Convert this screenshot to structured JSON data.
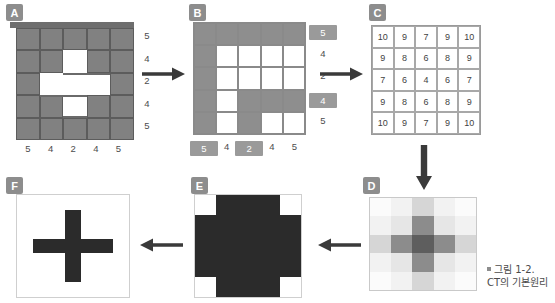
{
  "figure": {
    "caption_marker": "■",
    "caption_line1": "그림 1-2.",
    "caption_line2": "CT의 기본원리"
  },
  "colors": {
    "badge_bg": "#8d8d8d",
    "block_gray": "#818181",
    "grid_gray": "#8e8e8e",
    "dark": "#2b2b2b",
    "text": "#4a4a4a"
  },
  "panels": {
    "a": {
      "label": "A",
      "title": "object-block-stack",
      "row_labels": [
        "5",
        "4",
        "2",
        "4",
        "5"
      ],
      "col_labels": [
        "5",
        "4",
        "2",
        "4",
        "5"
      ],
      "occupancy": [
        [
          1,
          1,
          1,
          1,
          1
        ],
        [
          1,
          1,
          0,
          1,
          1
        ],
        [
          1,
          0,
          0,
          0,
          1
        ],
        [
          1,
          1,
          0,
          1,
          1
        ],
        [
          1,
          1,
          1,
          1,
          1
        ]
      ]
    },
    "b": {
      "label": "B",
      "title": "projection-grid",
      "row_labels": [
        "5",
        "4",
        "2",
        "4",
        "5"
      ],
      "row_highlight": [
        true,
        false,
        false,
        true,
        false
      ],
      "col_labels": [
        "5",
        "4",
        "2",
        "4",
        "5"
      ],
      "col_highlight": [
        true,
        false,
        true,
        false,
        false
      ],
      "cells": [
        [
          1,
          1,
          1,
          1,
          1
        ],
        [
          1,
          0,
          0,
          0,
          0
        ],
        [
          1,
          0,
          0,
          0,
          0
        ],
        [
          1,
          0,
          1,
          1,
          1
        ],
        [
          1,
          0,
          1,
          0,
          0
        ]
      ]
    },
    "c": {
      "label": "C",
      "title": "attenuation-matrix",
      "values": [
        [
          10,
          9,
          7,
          9,
          10
        ],
        [
          9,
          8,
          6,
          8,
          9
        ],
        [
          7,
          6,
          4,
          6,
          7
        ],
        [
          9,
          8,
          6,
          8,
          9
        ],
        [
          10,
          9,
          7,
          9,
          10
        ]
      ],
      "min": 4,
      "max": 10
    },
    "d": {
      "label": "D",
      "title": "grayscale-heatmap",
      "values": [
        [
          10,
          9,
          7,
          9,
          10
        ],
        [
          9,
          8,
          6,
          8,
          9
        ],
        [
          7,
          6,
          4,
          6,
          7
        ],
        [
          9,
          8,
          6,
          8,
          9
        ],
        [
          10,
          9,
          7,
          9,
          10
        ]
      ],
      "shades": [
        [
          "#fbfbfb",
          "#f2f2f2",
          "#d6d6d6",
          "#f2f2f2",
          "#fbfbfb"
        ],
        [
          "#f2f2f2",
          "#e6e6e6",
          "#8c8c8c",
          "#e6e6e6",
          "#f2f2f2"
        ],
        [
          "#d6d6d6",
          "#8c8c8c",
          "#5e5e5e",
          "#8c8c8c",
          "#d6d6d6"
        ],
        [
          "#f2f2f2",
          "#e6e6e6",
          "#8c8c8c",
          "#e6e6e6",
          "#f2f2f2"
        ],
        [
          "#fbfbfb",
          "#f2f2f2",
          "#d6d6d6",
          "#f2f2f2",
          "#fbfbfb"
        ]
      ]
    },
    "e": {
      "label": "E",
      "title": "thresholded-image",
      "cells": [
        [
          0,
          1,
          1,
          1,
          0
        ],
        [
          1,
          1,
          1,
          1,
          1
        ],
        [
          1,
          1,
          1,
          1,
          1
        ],
        [
          1,
          1,
          1,
          1,
          1
        ],
        [
          0,
          1,
          1,
          1,
          0
        ]
      ]
    },
    "f": {
      "label": "F",
      "title": "reconstructed-cross",
      "cells": [
        [
          0,
          0,
          0,
          0,
          0,
          0,
          0
        ],
        [
          0,
          0,
          0,
          1,
          0,
          0,
          0
        ],
        [
          0,
          0,
          0,
          1,
          0,
          0,
          0
        ],
        [
          0,
          1,
          1,
          1,
          1,
          1,
          0
        ],
        [
          0,
          0,
          0,
          1,
          0,
          0,
          0
        ],
        [
          0,
          0,
          0,
          1,
          0,
          0,
          0
        ],
        [
          0,
          0,
          0,
          0,
          0,
          0,
          0
        ]
      ]
    }
  },
  "arrows": [
    {
      "name": "arrow-a-to-b",
      "direction": "right"
    },
    {
      "name": "arrow-b-to-c",
      "direction": "right"
    },
    {
      "name": "arrow-c-to-d",
      "direction": "down"
    },
    {
      "name": "arrow-d-to-e",
      "direction": "left"
    },
    {
      "name": "arrow-e-to-f",
      "direction": "left"
    }
  ]
}
